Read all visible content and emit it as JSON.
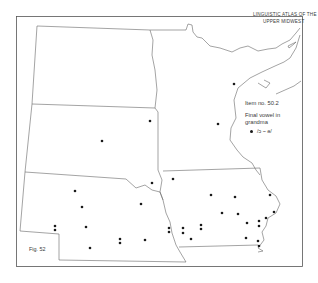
{
  "map": {
    "title_line1": "LINGUISTIC ATLAS OF THE",
    "title_line2": "UPPER MIDWEST",
    "item_number": "Item no. 50.2",
    "description_line1": "Final vowel in",
    "description_line2": "grandma",
    "legend": [
      {
        "symbol": "dot",
        "label": "/ɔ ~ ə/"
      }
    ],
    "figure_label": "Fig. 52",
    "colors": {
      "ink": "#3a3a3a",
      "dot": "#1a1a1a",
      "background": "#ffffff"
    },
    "states": [
      "North Dakota",
      "South Dakota",
      "Nebraska",
      "Minnesota",
      "Iowa"
    ],
    "data_points": [
      [
        234,
        84
      ],
      [
        218,
        124
      ],
      [
        150,
        121
      ],
      [
        102,
        141
      ],
      [
        152,
        183
      ],
      [
        75,
        191
      ],
      [
        82,
        207
      ],
      [
        141,
        204
      ],
      [
        55,
        226
      ],
      [
        55,
        230
      ],
      [
        86,
        227
      ],
      [
        90,
        248
      ],
      [
        120,
        239
      ],
      [
        120,
        243
      ],
      [
        145,
        240
      ],
      [
        173,
        179
      ],
      [
        211,
        195
      ],
      [
        222,
        213
      ],
      [
        169,
        228
      ],
      [
        169,
        232
      ],
      [
        183,
        228
      ],
      [
        183,
        233
      ],
      [
        191,
        239
      ],
      [
        201,
        225
      ],
      [
        201,
        229
      ],
      [
        235,
        197
      ],
      [
        238,
        214
      ],
      [
        247,
        223
      ],
      [
        259,
        221
      ],
      [
        259,
        226
      ],
      [
        270,
        195
      ],
      [
        274,
        212
      ],
      [
        266,
        218
      ],
      [
        246,
        238
      ],
      [
        258,
        241
      ],
      [
        259,
        246
      ]
    ]
  }
}
